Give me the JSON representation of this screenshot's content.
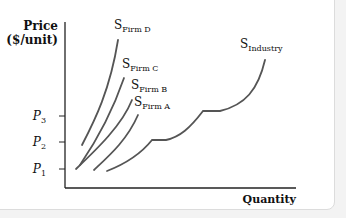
{
  "chart_data": {
    "type": "line",
    "title": "",
    "xlabel": "Quantity",
    "ylabel_line1": "Price",
    "ylabel_line2": "($/unit)",
    "y_ticks": [
      {
        "label": "P",
        "sub": "1",
        "y": 169
      },
      {
        "label": "P",
        "sub": "2",
        "y": 142
      },
      {
        "label": "P",
        "sub": "3",
        "y": 116
      }
    ],
    "series": [
      {
        "name": "S",
        "sub": "Firm D",
        "label_pos": [
          114,
          29
        ],
        "path": "M82,145 C95,120 110,90 118,40"
      },
      {
        "name": "S",
        "sub": "Firm C",
        "label_pos": [
          122,
          68
        ],
        "path": "M80,165 C97,140 113,110 124,78"
      },
      {
        "name": "S",
        "sub": "Firm B",
        "label_pos": [
          131,
          89
        ],
        "path": "M76,169 C98,148 122,125 132,100"
      },
      {
        "name": "S",
        "sub": "Firm A",
        "label_pos": [
          134,
          106
        ],
        "path": "M94,170 C110,155 127,140 138,115"
      },
      {
        "name": "S",
        "sub": "Industry",
        "label_pos": [
          240,
          48
        ],
        "path": "M107,171 C125,164 140,155 152,140 L166,140 C180,137 190,128 203,111 L220,111 C245,105 258,90 265,60"
      }
    ],
    "axis_color": "#222222",
    "curve_color": "#555555"
  }
}
